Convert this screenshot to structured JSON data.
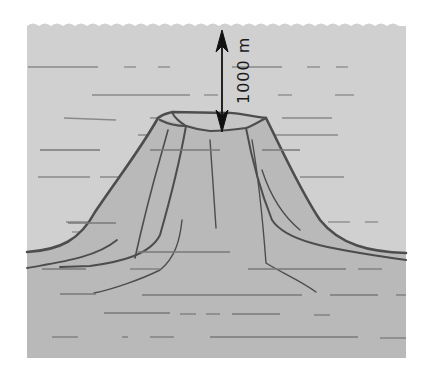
{
  "figure": {
    "colors": {
      "water": "#cfcfcf",
      "volcano": "#b9b9b9",
      "outline": "#4d4d4d",
      "strata": "#7a7a7a",
      "arrow": "#111111",
      "background": "#ffffff"
    },
    "depth_annotation": {
      "label": "1000 m",
      "from": "ocean surface",
      "to": "crater summit"
    }
  }
}
